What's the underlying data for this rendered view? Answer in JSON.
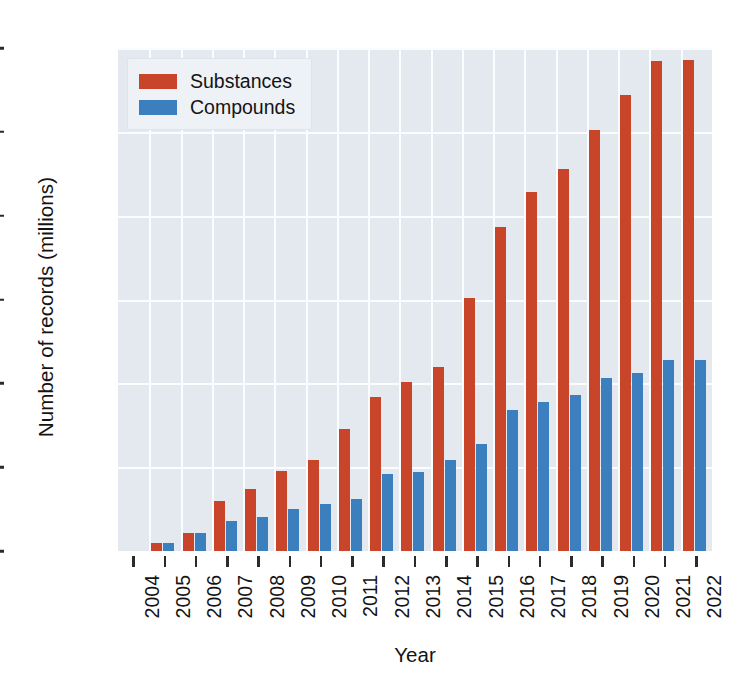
{
  "chart_data": {
    "type": "bar",
    "title": "",
    "xlabel": "Year",
    "ylabel": "Number of records (millions)",
    "categories": [
      "2004",
      "2005",
      "2006",
      "2007",
      "2008",
      "2009",
      "2010",
      "2011",
      "2012",
      "2013",
      "2014",
      "2015",
      "2016",
      "2017",
      "2018",
      "2019",
      "2020",
      "2021",
      "2022"
    ],
    "series": [
      {
        "name": "Substances",
        "color": "#c8452a",
        "values": [
          0,
          5,
          11,
          30,
          37,
          48,
          54,
          73,
          92,
          101,
          110,
          151,
          193,
          214,
          228,
          251,
          272,
          292,
          293
        ]
      },
      {
        "name": "Compounds",
        "color": "#3b7fbf",
        "values": [
          0,
          5,
          11,
          18,
          20,
          25,
          28,
          31,
          46,
          47,
          54,
          64,
          84,
          89,
          93,
          103,
          106,
          114,
          114
        ]
      }
    ],
    "ylim": [
      0,
      300
    ],
    "yticks": [
      0,
      50,
      100,
      150,
      200,
      250,
      300
    ],
    "ytick_labels": [
      "0",
      "50",
      "100",
      "150",
      "200",
      "250",
      "300"
    ],
    "grid": true,
    "legend_position": "upper left",
    "plot_background": "#e4e9ef",
    "gridline_color": "#fbfcfd"
  }
}
